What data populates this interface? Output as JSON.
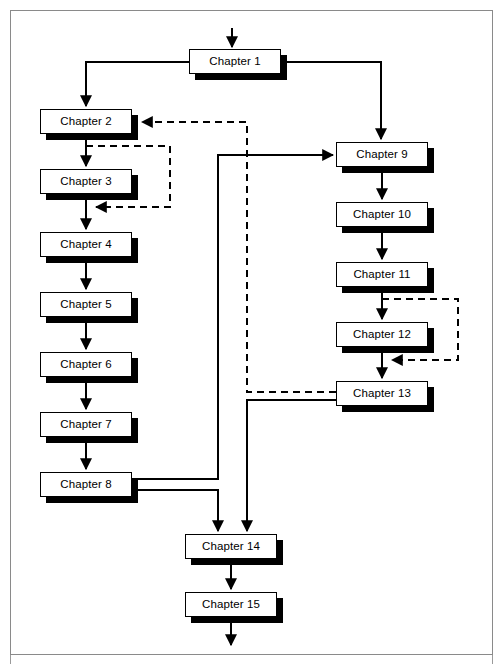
{
  "diagram": {
    "type": "flowchart",
    "frame": {
      "border_color": "#8a8a8a",
      "background": "#ffffff"
    },
    "node_style": {
      "fill": "#ffffff",
      "stroke": "#000000",
      "shadow": "#000000",
      "text_color": "#000000"
    },
    "nodes": [
      {
        "id": "ch1",
        "label": "Chapter 1",
        "x": 189,
        "y": 49,
        "w": 92,
        "h": 25
      },
      {
        "id": "ch2",
        "label": "Chapter 2",
        "x": 40,
        "y": 109,
        "w": 92,
        "h": 25
      },
      {
        "id": "ch3",
        "label": "Chapter 3",
        "x": 40,
        "y": 169,
        "w": 92,
        "h": 25
      },
      {
        "id": "ch4",
        "label": "Chapter 4",
        "x": 40,
        "y": 232,
        "w": 92,
        "h": 25
      },
      {
        "id": "ch5",
        "label": "Chapter 5",
        "x": 40,
        "y": 292,
        "w": 92,
        "h": 25
      },
      {
        "id": "ch6",
        "label": "Chapter 6",
        "x": 40,
        "y": 352,
        "w": 92,
        "h": 25
      },
      {
        "id": "ch7",
        "label": "Chapter 7",
        "x": 40,
        "y": 412,
        "w": 92,
        "h": 25
      },
      {
        "id": "ch8",
        "label": "Chapter 8",
        "x": 40,
        "y": 472,
        "w": 92,
        "h": 25
      },
      {
        "id": "ch9",
        "label": "Chapter 9",
        "x": 336,
        "y": 142,
        "w": 92,
        "h": 25
      },
      {
        "id": "ch10",
        "label": "Chapter 10",
        "x": 336,
        "y": 202,
        "w": 92,
        "h": 25
      },
      {
        "id": "ch11",
        "label": "Chapter 11",
        "x": 336,
        "y": 262,
        "w": 92,
        "h": 25
      },
      {
        "id": "ch12",
        "label": "Chapter 12",
        "x": 336,
        "y": 322,
        "w": 92,
        "h": 25
      },
      {
        "id": "ch13",
        "label": "Chapter 13",
        "x": 336,
        "y": 381,
        "w": 92,
        "h": 25
      },
      {
        "id": "ch14",
        "label": "Chapter 14",
        "x": 185,
        "y": 534,
        "w": 92,
        "h": 25
      },
      {
        "id": "ch15",
        "label": "Chapter 15",
        "x": 185,
        "y": 592,
        "w": 92,
        "h": 25
      }
    ],
    "edges": [
      {
        "from": "start",
        "to": "ch1",
        "style": "solid",
        "label": "entry arrow into Chapter 1"
      },
      {
        "from": "ch1",
        "to": "ch2",
        "style": "solid",
        "label": "Chapter 1 to Chapter 2"
      },
      {
        "from": "ch1",
        "to": "ch9",
        "style": "solid",
        "label": "Chapter 1 to Chapter 9"
      },
      {
        "from": "ch2",
        "to": "ch3",
        "style": "solid",
        "label": "Chapter 2 to Chapter 3"
      },
      {
        "from": "ch2",
        "to": "ch3",
        "style": "dashed",
        "label": "Chapter 2 optional bypass to Chapter 3 output"
      },
      {
        "from": "ch3",
        "to": "ch4",
        "style": "solid",
        "label": "Chapter 3 to Chapter 4"
      },
      {
        "from": "ch4",
        "to": "ch5",
        "style": "solid",
        "label": "Chapter 4 to Chapter 5"
      },
      {
        "from": "ch5",
        "to": "ch6",
        "style": "solid",
        "label": "Chapter 5 to Chapter 6"
      },
      {
        "from": "ch6",
        "to": "ch7",
        "style": "solid",
        "label": "Chapter 6 to Chapter 7"
      },
      {
        "from": "ch7",
        "to": "ch8",
        "style": "solid",
        "label": "Chapter 7 to Chapter 8"
      },
      {
        "from": "ch8",
        "to": "ch9",
        "style": "solid",
        "label": "Chapter 8 to Chapter 9"
      },
      {
        "from": "ch8",
        "to": "ch14",
        "style": "solid",
        "label": "Chapter 8 to Chapter 14"
      },
      {
        "from": "ch9",
        "to": "ch10",
        "style": "solid",
        "label": "Chapter 9 to Chapter 10"
      },
      {
        "from": "ch10",
        "to": "ch11",
        "style": "solid",
        "label": "Chapter 10 to Chapter 11"
      },
      {
        "from": "ch11",
        "to": "ch12",
        "style": "solid",
        "label": "Chapter 11 to Chapter 12"
      },
      {
        "from": "ch11",
        "to": "ch12",
        "style": "dashed",
        "label": "Chapter 11 optional bypass to Chapter 12 output"
      },
      {
        "from": "ch12",
        "to": "ch13",
        "style": "solid",
        "label": "Chapter 12 to Chapter 13"
      },
      {
        "from": "ch13",
        "to": "ch2",
        "style": "dashed",
        "label": "Chapter 13 feedback to Chapter 2"
      },
      {
        "from": "ch13",
        "to": "ch14",
        "style": "solid",
        "label": "Chapter 13 to Chapter 14"
      },
      {
        "from": "ch14",
        "to": "ch15",
        "style": "solid",
        "label": "Chapter 14 to Chapter 15"
      },
      {
        "from": "ch15",
        "to": "end",
        "style": "solid",
        "label": "exit arrow from Chapter 15"
      }
    ]
  }
}
